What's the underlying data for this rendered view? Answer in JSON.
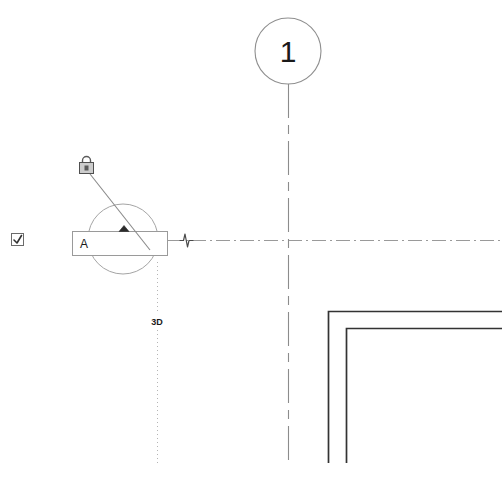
{
  "view": {
    "name": "floor-plan-view",
    "background_color": "#ffffff",
    "width": 502,
    "height": 498
  },
  "grid_bubble": {
    "label": "1",
    "icon": "grid-bubble-circle",
    "center_x": 288,
    "center_y": 51,
    "radius": 33,
    "stroke_color": "#808080",
    "text_color": "#1a1a1a"
  },
  "grid_line_vertical": {
    "name": "grid-line-1",
    "x": 288,
    "y_start": 84,
    "y_end": 466,
    "pattern": "dash-dot",
    "stroke_color": "#8c8c8c"
  },
  "centerline_horizontal": {
    "name": "reference-centerline",
    "y": 240,
    "x_start": 168,
    "x_end": 502,
    "pattern": "dash-dot",
    "stroke_color": "#9a9a9a"
  },
  "section_marker": {
    "name": "section-marker-a",
    "label": "A",
    "circle": {
      "center_x": 123,
      "center_y": 239,
      "radius": 35,
      "stroke_color": "#9e9e9e"
    },
    "head_box": {
      "x": 72,
      "y": 231,
      "width": 96,
      "height": 25,
      "stroke_color": "#9a9a9a",
      "fill_color": "#ffffff"
    },
    "arrow": {
      "icon": "section-direction-arrow",
      "x": 124,
      "y": 231,
      "fill_color": "#2b2b2b"
    }
  },
  "lock_control": {
    "icon": "padlock-icon",
    "name": "pin-lock-icon",
    "x": 79,
    "y": 157,
    "width": 17,
    "height": 17,
    "stroke_color": "#555555",
    "fill_color": "#c9c9c9"
  },
  "leader_line": {
    "name": "lock-leader-line",
    "x1": 90,
    "y1": 174,
    "x2": 150,
    "y2": 250,
    "stroke_color": "#8a8a8a"
  },
  "break_symbol": {
    "icon": "line-break-symbol",
    "name": "centerline-break-symbol",
    "x": 186,
    "y": 240,
    "stroke_color": "#5a5a5a"
  },
  "extension_line_vertical": {
    "name": "view-extent-dotted-line",
    "x": 157,
    "y_start": 262,
    "y_end": 466,
    "pattern": "dotted",
    "stroke_color": "#b5b5b5"
  },
  "view_tag_3d": {
    "label": "3D",
    "name": "view-depth-label",
    "x": 157,
    "y": 321,
    "text_color": "#1a1a1a"
  },
  "checkbox": {
    "name": "visibility-checkbox",
    "label": "",
    "checked": true,
    "icon": "checkbox-checked-icon",
    "x": 11,
    "y": 233,
    "size": 13,
    "stroke_color": "#6b6b6b",
    "mark_color": "#333333"
  },
  "walls": [
    {
      "name": "wall-outer",
      "corner_x": 328,
      "corner_y": 311,
      "x_end": 502,
      "y_end": 463,
      "stroke_color": "#333333",
      "stroke_width": 1.6
    },
    {
      "name": "wall-inner",
      "corner_x": 346,
      "corner_y": 328,
      "x_end": 502,
      "y_end": 463,
      "stroke_color": "#333333",
      "stroke_width": 1.6
    }
  ]
}
